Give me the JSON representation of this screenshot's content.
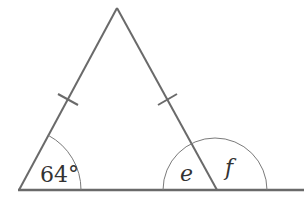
{
  "diagram": {
    "type": "isosceles-triangle-exterior-angle",
    "colors": {
      "line": "#6a6a6a",
      "arc": "#7a7a7a",
      "text": "#333333",
      "background": "#ffffff"
    },
    "vertices": {
      "apex": [
        117,
        8
      ],
      "base_left": [
        19,
        190
      ],
      "base_right": [
        217,
        190
      ]
    },
    "base_line_end": [
      304,
      190
    ],
    "equal_side_marks": 2,
    "angles": [
      {
        "id": "base-left",
        "label": "64°",
        "italic": false
      },
      {
        "id": "interior-right",
        "label": "e",
        "italic": true
      },
      {
        "id": "exterior-right",
        "label": "f",
        "italic": true
      }
    ]
  }
}
